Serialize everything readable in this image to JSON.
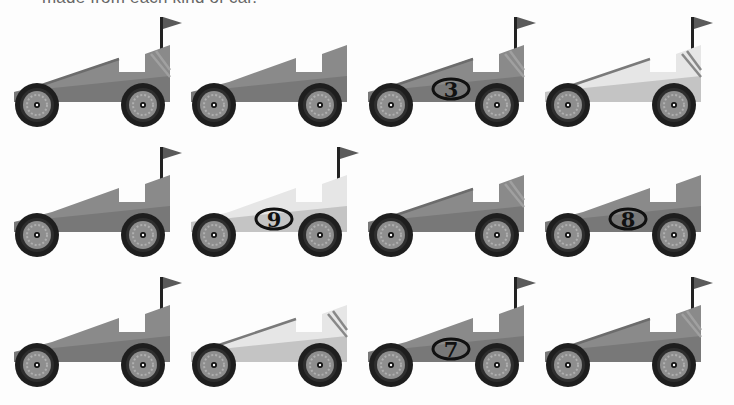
{
  "caption": "made from each kind of car.",
  "colors": {
    "dark_body_top": "#8a8a8a",
    "dark_body_bottom": "#787878",
    "light_body_top": "#e6e6e6",
    "light_body_bottom": "#c4c4c4",
    "stripe": "#a0a0a0",
    "hood_stripe_dark": "#6c6c6c",
    "tire": "#1e1e1e",
    "rim": "#8e8e8e",
    "flag": "#5a5a5a",
    "badge": "#111111"
  },
  "cars": [
    {
      "row": 1,
      "col": 1,
      "color": "dark",
      "flag": true,
      "stripes": true,
      "hood_stripe": true,
      "number": ""
    },
    {
      "row": 1,
      "col": 2,
      "color": "dark",
      "flag": false,
      "stripes": false,
      "hood_stripe": false,
      "number": ""
    },
    {
      "row": 1,
      "col": 3,
      "color": "dark",
      "flag": true,
      "stripes": true,
      "hood_stripe": true,
      "number": "3"
    },
    {
      "row": 1,
      "col": 4,
      "color": "light",
      "flag": true,
      "stripes": true,
      "hood_stripe": true,
      "number": ""
    },
    {
      "row": 2,
      "col": 1,
      "color": "dark",
      "flag": true,
      "stripes": false,
      "hood_stripe": false,
      "number": ""
    },
    {
      "row": 2,
      "col": 2,
      "color": "light",
      "flag": true,
      "stripes": false,
      "hood_stripe": false,
      "number": "9"
    },
    {
      "row": 2,
      "col": 3,
      "color": "dark",
      "flag": false,
      "stripes": true,
      "hood_stripe": true,
      "number": ""
    },
    {
      "row": 2,
      "col": 4,
      "color": "dark",
      "flag": false,
      "stripes": false,
      "hood_stripe": false,
      "number": "8"
    },
    {
      "row": 3,
      "col": 1,
      "color": "dark",
      "flag": true,
      "stripes": false,
      "hood_stripe": false,
      "number": ""
    },
    {
      "row": 3,
      "col": 2,
      "color": "light",
      "flag": false,
      "stripes": true,
      "hood_stripe": true,
      "number": ""
    },
    {
      "row": 3,
      "col": 3,
      "color": "dark",
      "flag": true,
      "stripes": false,
      "hood_stripe": false,
      "number": "7"
    },
    {
      "row": 3,
      "col": 4,
      "color": "dark",
      "flag": true,
      "stripes": true,
      "hood_stripe": true,
      "number": ""
    }
  ]
}
